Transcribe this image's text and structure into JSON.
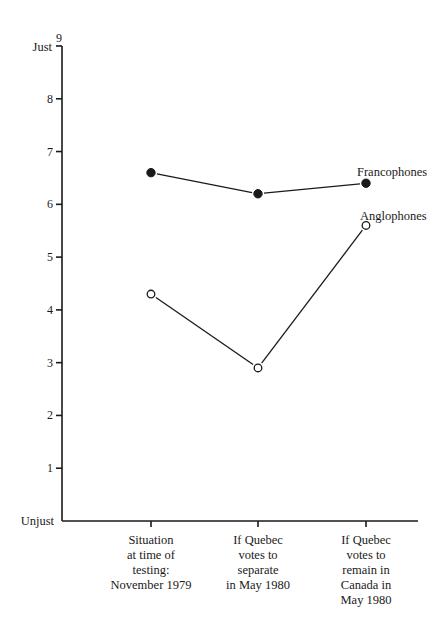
{
  "chart_data": {
    "type": "line",
    "title": "",
    "xlabel": "",
    "ylabel": "",
    "ylim": [
      0,
      9
    ],
    "yticks": [
      1,
      2,
      3,
      4,
      5,
      6,
      7,
      8,
      9
    ],
    "y_end_labels": {
      "top": "Just",
      "bottom": "Unjust"
    },
    "grid": false,
    "legend_position": "inline labels at right end of each series",
    "categories": [
      [
        "Situation",
        "at time of",
        "testing:",
        "November 1979"
      ],
      [
        "If Quebec",
        "votes to",
        "separate",
        "in May 1980"
      ],
      [
        "If Quebec",
        "votes to",
        "remain in",
        "Canada in",
        "May 1980"
      ]
    ],
    "series": [
      {
        "name": "Francophones",
        "marker": "filled-circle",
        "values": [
          6.6,
          6.2,
          6.4
        ]
      },
      {
        "name": "Anglophones",
        "marker": "open-circle",
        "values": [
          4.3,
          2.9,
          5.6
        ]
      }
    ]
  },
  "axis": {
    "just_label": "Just",
    "unjust_label": "Unjust",
    "ticks": [
      "1",
      "2",
      "3",
      "4",
      "5",
      "6",
      "7",
      "8",
      "9"
    ]
  },
  "labels": {
    "francophones": "Francophones",
    "anglophones": "Anglophones"
  },
  "colors": {
    "ink": "#1a1a1a",
    "background": "#ffffff"
  }
}
